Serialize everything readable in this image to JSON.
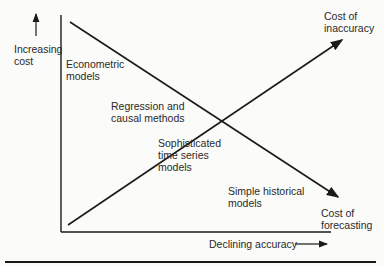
{
  "diagram": {
    "y_axis_label": [
      "Increasing",
      "cost"
    ],
    "x_axis_label": "Declining accuracy",
    "curves": [
      {
        "name": "Cost of inaccuracy",
        "label": [
          "Cost of",
          "inaccuracy"
        ],
        "direction": "rising"
      },
      {
        "name": "Cost of forecasting",
        "label": [
          "Cost of",
          "forecasting"
        ],
        "direction": "declining"
      }
    ],
    "methods": [
      {
        "label": [
          "Econometric",
          "models"
        ]
      },
      {
        "label": [
          "Regression and",
          "causal methods"
        ]
      },
      {
        "label": [
          "Sophisticated",
          "time series",
          "models"
        ]
      },
      {
        "label": [
          "Simple historical",
          "models"
        ]
      }
    ],
    "colors": {
      "line": "#1a1a1a",
      "background": "#fbfbf9",
      "text": "#2a2a2a"
    }
  }
}
